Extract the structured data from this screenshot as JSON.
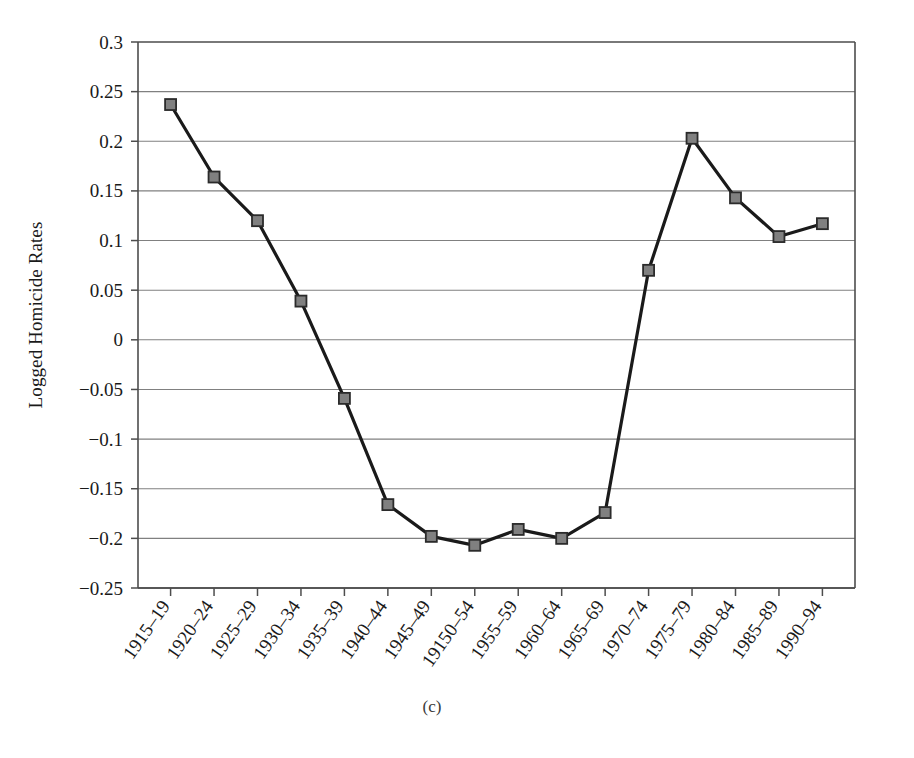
{
  "figure": {
    "caption": "(c)",
    "background_color": "#ffffff"
  },
  "chart_data": {
    "type": "line",
    "title": "",
    "subtitle": "",
    "xlabel": "",
    "ylabel": "Logged Homicide Rates",
    "categories": [
      "1915–19",
      "1920–24",
      "1925–29",
      "1930–34",
      "1935–39",
      "1940–44",
      "1945–49",
      "19150–54",
      "1955–59",
      "1960–64",
      "1965–69",
      "1970–74",
      "1975–79",
      "1980–84",
      "1985–89",
      "1990–94"
    ],
    "values": [
      0.237,
      0.164,
      0.12,
      0.039,
      -0.059,
      -0.166,
      -0.198,
      -0.207,
      -0.191,
      -0.2,
      -0.174,
      0.07,
      0.203,
      0.143,
      0.104,
      0.117
    ],
    "ylim": [
      -0.25,
      0.3
    ],
    "ytick_labels": [
      "0.3",
      "0.25",
      "0.2",
      "0.15",
      "0.1",
      "0.05",
      "0",
      "−0.05",
      "−0.1",
      "−0.15",
      "−0.2",
      "−0.25"
    ],
    "ytick_values": [
      0.3,
      0.25,
      0.2,
      0.15,
      0.1,
      0.05,
      0,
      -0.05,
      -0.1,
      -0.15,
      -0.2,
      -0.25
    ],
    "grid": "horizontal",
    "legend": "none",
    "series_name": "Logged Homicide Rates",
    "line_color": "#1a1a1a",
    "line_width": 3.2,
    "marker_shape": "square",
    "marker_fill": "#808080",
    "marker_edge": "#2b2b2b",
    "marker_size": 11,
    "axis_color": "#4d4d4d",
    "grid_color": "#808080",
    "xtick_rotation": -55
  },
  "plot_geometry": {
    "left": 138,
    "right": 855,
    "top": 42,
    "bottom": 588
  }
}
